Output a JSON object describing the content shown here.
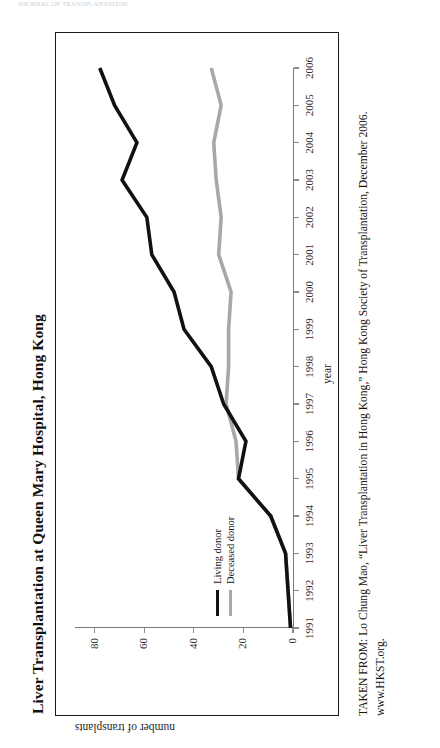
{
  "page": {
    "header_strip": "JOURNAL OF TRANSPLANTATION"
  },
  "figure": {
    "title": "Liver Transplantation at Queen Mary Hospital, Hong Kong",
    "attribution": "TAKEN FROM: Lo Chung Mao, “Liver Transplantation in Hong Kong,” Hong Kong Society of Transplantation, December 2006. www.HKST.org.",
    "colors": {
      "living_donor": "#111111",
      "deceased_donor": "#a8a8a8",
      "axis": "#7a7a7a",
      "frame": "#1a1a1a"
    }
  },
  "chart_data": {
    "type": "line",
    "title": "Liver Transplantation at Queen Mary Hospital, Hong Kong",
    "xlabel": "year",
    "ylabel": "number of transplants",
    "grid": false,
    "legend_position": "inside-bottom-left",
    "xlim": [
      1991,
      2006
    ],
    "ylim": [
      0,
      88
    ],
    "yticks": [
      0,
      20,
      40,
      60,
      80
    ],
    "ytick_labels": [
      "0",
      "20",
      "40",
      "60",
      "80"
    ],
    "x": [
      1991,
      1992,
      1993,
      1994,
      1995,
      1996,
      1997,
      1998,
      1999,
      2000,
      2001,
      2002,
      2003,
      2004,
      2005,
      2006
    ],
    "xtick_labels": [
      "1991",
      "1992",
      "1993",
      "1994",
      "1995",
      "1996",
      "1997",
      "1998",
      "1999",
      "2000",
      "2001",
      "2002",
      "2003",
      "2004",
      "2005",
      "2006"
    ],
    "series": [
      {
        "name": "Living donor",
        "color": "#111111",
        "values": [
          1,
          2,
          3,
          9,
          22,
          19,
          28,
          33,
          44,
          48,
          57,
          59,
          69,
          63,
          72,
          78
        ]
      },
      {
        "name": "Deceased donor",
        "color": "#a8a8a8",
        "values": [
          1,
          2,
          3,
          9,
          22,
          23,
          27,
          26,
          26,
          25,
          30,
          29,
          31,
          32,
          29,
          33
        ]
      }
    ]
  },
  "legend": {
    "items": [
      {
        "label": "Living donor",
        "color": "#111111"
      },
      {
        "label": "Deceased donor",
        "color": "#a8a8a8"
      }
    ]
  }
}
